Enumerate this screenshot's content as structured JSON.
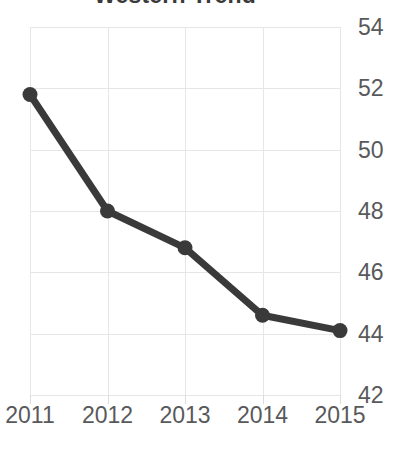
{
  "chart_data": {
    "type": "line",
    "title": "Western Trend",
    "xlabel": "",
    "ylabel": "",
    "categories": [
      "2011",
      "2012",
      "2013",
      "2014",
      "2015"
    ],
    "values": [
      51.8,
      48.0,
      46.8,
      44.6,
      44.1
    ],
    "series": [
      {
        "name": "Western Trend",
        "values": [
          51.8,
          48.0,
          46.8,
          44.6,
          44.1
        ]
      }
    ],
    "ylim": [
      42,
      54
    ],
    "yticks": [
      "54",
      "52",
      "50",
      "48",
      "46",
      "44",
      "42"
    ],
    "ytick_values": [
      54,
      52,
      50,
      48,
      46,
      44,
      42
    ],
    "xticks": [
      "2011",
      "2012",
      "2013",
      "2014",
      "2015"
    ],
    "grid": true,
    "legend": false,
    "legend_position": "none",
    "y_axis_position": "right",
    "marker": "circle",
    "colors": {
      "line": "#3a3a3a",
      "marker": "#3a3a3a",
      "grid": "#e6e6e6",
      "tick_label": "#58595b",
      "title": "#3a3a3a",
      "background": "#ffffff"
    }
  }
}
